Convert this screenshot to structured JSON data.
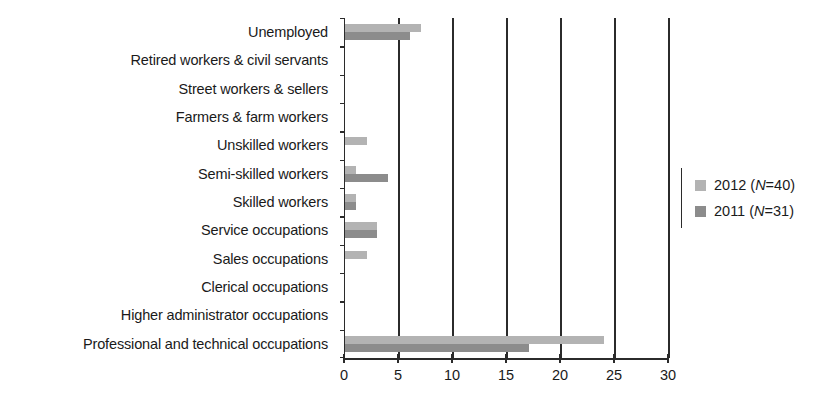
{
  "chart_data": {
    "type": "bar",
    "orientation": "horizontal",
    "title": "",
    "xlabel": "",
    "ylabel": "",
    "xlim": [
      0,
      30
    ],
    "xticks": [
      0,
      5,
      10,
      15,
      20,
      25,
      30
    ],
    "grid": true,
    "grid_axis": "x",
    "legend_position": "right",
    "categories": [
      "Unemployed",
      "Retired workers & civil servants",
      "Street workers & sellers",
      "Farmers & farm workers",
      "Unskilled workers",
      "Semi-skilled workers",
      "Skilled workers",
      "Service occupations",
      "Sales occupations",
      "Clerical occupations",
      "Higher administrator occupations",
      "Professional and technical occupations"
    ],
    "series": [
      {
        "name": "2012 (N=40)",
        "year": "2012",
        "n": 40,
        "color": "#b3b3b3",
        "values": [
          7,
          0,
          0,
          0,
          2,
          1,
          1,
          3,
          2,
          0,
          0,
          24
        ]
      },
      {
        "name": "2011 (N=31)",
        "year": "2011",
        "n": 31,
        "color": "#8c8c8c",
        "values": [
          6,
          0,
          0,
          0,
          0,
          4,
          1,
          3,
          0,
          0,
          0,
          17
        ]
      }
    ]
  },
  "legend": {
    "entries": [
      {
        "label_prefix": "2012 (",
        "label_italic": "N",
        "label_suffix": "=40)",
        "full": "2012 (N=40)",
        "color": "#b3b3b3"
      },
      {
        "label_prefix": "2011 (",
        "label_italic": "N",
        "label_suffix": "=31)",
        "full": "2011 (N=31)",
        "color": "#8c8c8c"
      }
    ]
  },
  "colors": {
    "series_2012": "#b3b3b3",
    "series_2011": "#8c8c8c",
    "axis": "#2b2b2b",
    "text": "#1a1a1a",
    "background": "#ffffff"
  }
}
